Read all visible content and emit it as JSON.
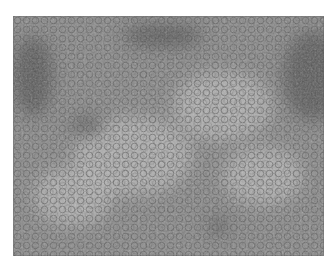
{
  "image": {
    "subject": "brightfield micrograph of densely packed round cells",
    "tone": "grayscale",
    "colors": {
      "background": "#ffffff",
      "base": "#8a8a8a",
      "dark": "#3a3a3a",
      "light": "#b8b8b8"
    },
    "dark_patches": [
      {
        "x": 75,
        "y": 110,
        "rx": 16,
        "ry": 9
      },
      {
        "x": 205,
        "y": 210,
        "rx": 10,
        "ry": 8
      },
      {
        "x": 300,
        "y": 60,
        "rx": 30,
        "ry": 45
      },
      {
        "x": 20,
        "y": 60,
        "rx": 20,
        "ry": 40
      },
      {
        "x": 150,
        "y": 20,
        "rx": 40,
        "ry": 12
      }
    ],
    "light_patches": [
      {
        "x": 120,
        "y": 140,
        "rx": 60,
        "ry": 40
      },
      {
        "x": 210,
        "y": 90,
        "rx": 50,
        "ry": 35
      },
      {
        "x": 60,
        "y": 180,
        "rx": 40,
        "ry": 30
      },
      {
        "x": 250,
        "y": 160,
        "rx": 40,
        "ry": 30
      }
    ]
  }
}
